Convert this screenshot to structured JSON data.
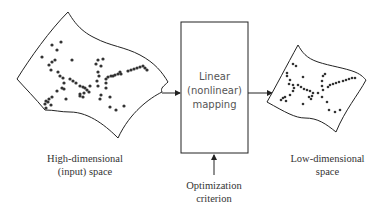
{
  "diagram": {
    "nodes": {
      "input_space": {
        "label_line1": "High-dimensional",
        "label_line2": "(input) space"
      },
      "mapping": {
        "label_line1": "Linear",
        "label_line2": "(nonlinear)",
        "label_line3": "mapping"
      },
      "output_space": {
        "label_line1": "Low-dimensional",
        "label_line2": "space"
      },
      "criterion": {
        "label_line1": "Optimization",
        "label_line2": "criterion"
      }
    },
    "edges": [
      {
        "from": "input_space",
        "to": "mapping"
      },
      {
        "from": "mapping",
        "to": "output_space"
      },
      {
        "from": "criterion",
        "to": "mapping"
      }
    ],
    "colors": {
      "stroke": "#222222",
      "points": "#333333",
      "text": "#333333"
    }
  }
}
